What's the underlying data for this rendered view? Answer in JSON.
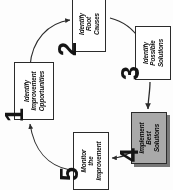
{
  "diagram": {
    "background_color": "#fdfdfd",
    "line_color": "#2b2b2b",
    "highlight_color": "#a9a9a9",
    "orientation": "rotated-90-ccw",
    "steps": [
      {
        "number": "1",
        "label": "Identify\nImprovement\nOpportunities",
        "line1": "Identify",
        "line2": "Improvement",
        "line3": "Opportunities",
        "highlighted": false
      },
      {
        "number": "2",
        "label": "Identify\nRoot\nCauses",
        "line1": "Identify",
        "line2": "Root",
        "line3": "Causes",
        "highlighted": false
      },
      {
        "number": "3",
        "label": "Identify\nPossible\nSolutions",
        "line1": "Identify",
        "line2": "Possible",
        "line3": "Solutions",
        "highlighted": false
      },
      {
        "number": "4",
        "label": "Implement\nBest\nSolutions",
        "line1": "Implement",
        "line2": "Best",
        "line3": "Solutions",
        "highlighted": true
      },
      {
        "number": "5",
        "label": "Monitor\nthe\nImprovement",
        "line1": "Monitor",
        "line2": "the",
        "line3": "Improvement",
        "highlighted": false
      }
    ],
    "connectors": [
      {
        "from": "1",
        "to": "2",
        "style": "curved-arrow"
      },
      {
        "from": "2",
        "to": "3",
        "style": "curved-arrow"
      },
      {
        "from": "3",
        "to": "4",
        "style": "straight-arrow"
      },
      {
        "from": "4",
        "to": "5",
        "style": "curved-arrow"
      },
      {
        "from": "5",
        "to": "1",
        "style": "curved-arrow"
      }
    ]
  }
}
